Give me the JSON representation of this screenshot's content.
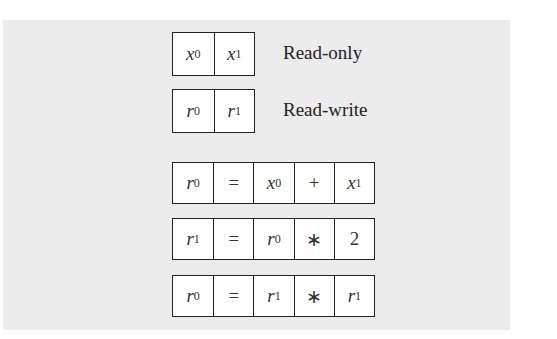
{
  "legend": [
    {
      "cells": [
        {
          "var": "x",
          "sub": "0"
        },
        {
          "var": "x",
          "sub": "1"
        }
      ],
      "label": "Read-only"
    },
    {
      "cells": [
        {
          "var": "r",
          "sub": "0"
        },
        {
          "var": "r",
          "sub": "1"
        }
      ],
      "label": "Read-write"
    }
  ],
  "instructions": [
    [
      {
        "var": "r",
        "sub": "0"
      },
      {
        "op": "="
      },
      {
        "var": "x",
        "sub": "0"
      },
      {
        "op": "+"
      },
      {
        "var": "x",
        "sub": "1"
      }
    ],
    [
      {
        "var": "r",
        "sub": "1"
      },
      {
        "op": "="
      },
      {
        "var": "r",
        "sub": "0"
      },
      {
        "op": "∗"
      },
      {
        "op": "2"
      }
    ],
    [
      {
        "var": "r",
        "sub": "0"
      },
      {
        "op": "="
      },
      {
        "var": "r",
        "sub": "1"
      },
      {
        "op": "∗"
      },
      {
        "var": "r",
        "sub": "1"
      }
    ]
  ],
  "colors": {
    "panel": "#ececec",
    "border": "#222222",
    "cell": "#ffffff"
  }
}
